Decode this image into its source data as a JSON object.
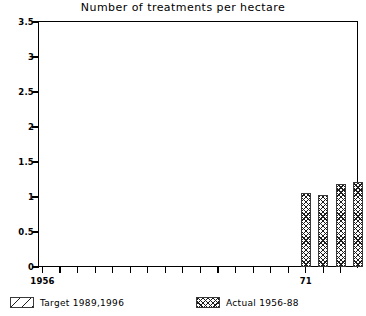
{
  "chart_data": {
    "type": "bar",
    "title": "Number of treatments per hectare",
    "xlabel": "",
    "ylabel": "",
    "ylim": [
      0,
      3.5
    ],
    "yticks": [
      "0",
      "0.5",
      "1",
      "1.5",
      "2",
      "2.5",
      "3",
      "3.5"
    ],
    "ytick_values": [
      0,
      0.5,
      1,
      1.5,
      2,
      2.5,
      3,
      3.5
    ],
    "xtick_labels": [
      "1956",
      "71",
      "76",
      "80",
      "85",
      "89",
      "96"
    ],
    "xtick_label_years": [
      1956,
      1971,
      1976,
      1980,
      1985,
      1989,
      1996
    ],
    "grid": false,
    "legend_position": "below-axes",
    "series": [
      {
        "name": "Actual 1956-88",
        "pattern": "crosshatch",
        "categories": [
          1971,
          1972,
          1973,
          1974,
          1975,
          1976,
          1977,
          1978,
          1979,
          1980,
          1981,
          1982,
          1983,
          1984,
          1985,
          1986,
          1987,
          1988
        ],
        "values": [
          1.06,
          1.03,
          1.19,
          1.22,
          1.3,
          1.35,
          1.27,
          1.53,
          2.19,
          2.2,
          2.95,
          3.06,
          3.47,
          3.05,
          2.75,
          2.6,
          2.45,
          2.3
        ]
      },
      {
        "name": "Target 1989,1996",
        "pattern": "diagonal-hatch",
        "categories": [
          1989,
          1996
        ],
        "values": [
          2.0,
          1.33
        ]
      }
    ],
    "bars": [
      {
        "label": "1971",
        "value": 1.06,
        "kind": "actual"
      },
      {
        "label": "1972",
        "value": 1.03,
        "kind": "actual"
      },
      {
        "label": "1973",
        "value": 1.19,
        "kind": "actual"
      },
      {
        "label": "1974",
        "value": 1.22,
        "kind": "actual"
      },
      {
        "label": "1975",
        "value": 1.3,
        "kind": "actual"
      },
      {
        "label": "1976",
        "value": 1.35,
        "kind": "actual"
      },
      {
        "label": "1977",
        "value": 1.27,
        "kind": "actual"
      },
      {
        "label": "1978",
        "value": 1.53,
        "kind": "actual"
      },
      {
        "label": "1979",
        "value": 2.19,
        "kind": "actual"
      },
      {
        "label": "1980",
        "value": 2.2,
        "kind": "actual"
      },
      {
        "label": "1981",
        "value": 2.95,
        "kind": "actual"
      },
      {
        "label": "1982",
        "value": 3.06,
        "kind": "actual"
      },
      {
        "label": "1983",
        "value": 3.47,
        "kind": "actual"
      },
      {
        "label": "1984",
        "value": 3.05,
        "kind": "actual"
      },
      {
        "label": "1985",
        "value": 2.75,
        "kind": "actual"
      },
      {
        "label": "1986",
        "value": 2.6,
        "kind": "actual"
      },
      {
        "label": "1987",
        "value": 2.45,
        "kind": "actual"
      },
      {
        "label": "1988",
        "value": 2.3,
        "kind": "actual"
      },
      {
        "label": "1989",
        "value": 2.0,
        "kind": "target"
      },
      {
        "label": "1996",
        "value": 1.33,
        "kind": "target"
      }
    ]
  },
  "legend": {
    "target": {
      "label": "Target 1989,1996",
      "swatch": "diagonal-hatch-swatch"
    },
    "actual": {
      "label": "Actual 1956-88",
      "swatch": "crosshatch-swatch"
    }
  },
  "colors": {
    "axis": "#000000",
    "hatch": "#1c1c1c",
    "bar_border": "#3a3a3a",
    "background": "#ffffff"
  }
}
